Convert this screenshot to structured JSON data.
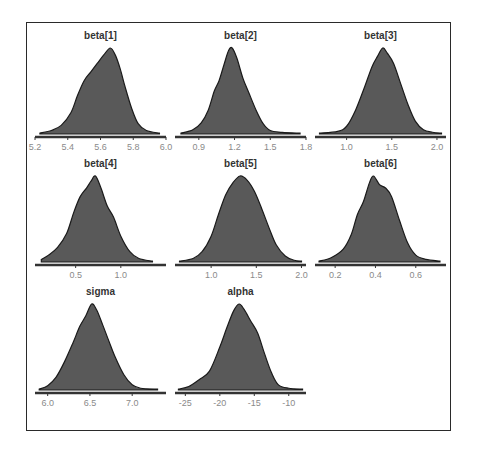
{
  "figure": {
    "frame_color": "#2a2a2a",
    "fill_color": "#595959",
    "line_color": "#1a1a1a",
    "axis_color": "#333333",
    "tick_label_color": "#8a8a8a",
    "title_color": "#333333"
  },
  "chart_data": [
    {
      "type": "area",
      "title": "beta[1]",
      "xlabel": "",
      "ylabel": "",
      "xlim": [
        5.2,
        6.0
      ],
      "ticks": [
        5.2,
        5.4,
        5.6,
        5.8,
        6.0
      ],
      "tick_labels": [
        "5.2",
        "5.4",
        "5.6",
        "5.8",
        "6.0"
      ],
      "grid": false,
      "x": [
        5.23,
        5.3,
        5.36,
        5.42,
        5.46,
        5.5,
        5.54,
        5.58,
        5.62,
        5.66,
        5.69,
        5.72,
        5.75,
        5.79,
        5.83,
        5.88,
        5.96
      ],
      "density": [
        0.01,
        0.04,
        0.1,
        0.25,
        0.45,
        0.62,
        0.72,
        0.82,
        0.92,
        1.0,
        0.92,
        0.76,
        0.55,
        0.3,
        0.12,
        0.04,
        0.01
      ]
    },
    {
      "type": "area",
      "title": "beta[2]",
      "xlim": [
        0.7,
        1.8
      ],
      "ticks": [
        0.9,
        1.2,
        1.5,
        1.8
      ],
      "tick_labels": [
        "0.9",
        "1.2",
        "1.5",
        "1.8"
      ],
      "x": [
        0.75,
        0.85,
        0.92,
        0.98,
        1.03,
        1.07,
        1.11,
        1.15,
        1.18,
        1.22,
        1.27,
        1.32,
        1.38,
        1.44,
        1.5,
        1.6,
        1.75
      ],
      "density": [
        0.01,
        0.05,
        0.13,
        0.28,
        0.5,
        0.62,
        0.8,
        0.97,
        1.0,
        0.88,
        0.65,
        0.48,
        0.28,
        0.12,
        0.04,
        0.02,
        0.01
      ]
    },
    {
      "type": "area",
      "title": "beta[3]",
      "xlim": [
        0.65,
        2.1
      ],
      "ticks": [
        1.0,
        1.5,
        2.0
      ],
      "tick_labels": [
        "1.0",
        "1.5",
        "2.0"
      ],
      "x": [
        0.7,
        0.9,
        1.0,
        1.1,
        1.2,
        1.28,
        1.34,
        1.4,
        1.45,
        1.52,
        1.6,
        1.68,
        1.76,
        1.85,
        1.95,
        2.05
      ],
      "density": [
        0.01,
        0.03,
        0.09,
        0.28,
        0.55,
        0.78,
        0.9,
        1.0,
        0.94,
        0.82,
        0.58,
        0.34,
        0.15,
        0.05,
        0.02,
        0.01
      ]
    },
    {
      "type": "area",
      "title": "beta[4]",
      "xlim": [
        0.05,
        1.5
      ],
      "ticks": [
        0.5,
        1.0
      ],
      "tick_labels": [
        "0.5",
        "1.0"
      ],
      "x": [
        0.12,
        0.2,
        0.3,
        0.4,
        0.48,
        0.55,
        0.62,
        0.67,
        0.72,
        0.78,
        0.85,
        0.92,
        1.0,
        1.1,
        1.2,
        1.35
      ],
      "density": [
        0.03,
        0.08,
        0.17,
        0.33,
        0.58,
        0.76,
        0.86,
        0.94,
        1.0,
        0.86,
        0.65,
        0.52,
        0.3,
        0.12,
        0.04,
        0.01
      ]
    },
    {
      "type": "area",
      "title": "beta[5]",
      "xlim": [
        0.6,
        2.05
      ],
      "ticks": [
        1.0,
        1.5,
        2.0
      ],
      "tick_labels": [
        "1.0",
        "1.5",
        "2.0"
      ],
      "x": [
        0.65,
        0.8,
        0.9,
        1.0,
        1.08,
        1.16,
        1.24,
        1.32,
        1.4,
        1.48,
        1.56,
        1.64,
        1.72,
        1.82,
        1.92,
        2.0
      ],
      "density": [
        0.01,
        0.04,
        0.12,
        0.3,
        0.55,
        0.78,
        0.92,
        1.0,
        0.95,
        0.82,
        0.62,
        0.4,
        0.2,
        0.07,
        0.02,
        0.01
      ]
    },
    {
      "type": "area",
      "title": "beta[6]",
      "xlim": [
        0.1,
        0.75
      ],
      "ticks": [
        0.2,
        0.4,
        0.6
      ],
      "tick_labels": [
        "0.2",
        "0.4",
        "0.6"
      ],
      "x": [
        0.12,
        0.18,
        0.24,
        0.28,
        0.31,
        0.34,
        0.37,
        0.39,
        0.42,
        0.45,
        0.48,
        0.52,
        0.56,
        0.6,
        0.65,
        0.72
      ],
      "density": [
        0.01,
        0.05,
        0.15,
        0.32,
        0.55,
        0.7,
        0.92,
        1.0,
        0.9,
        0.86,
        0.76,
        0.48,
        0.22,
        0.08,
        0.03,
        0.01
      ]
    },
    {
      "type": "area",
      "title": "sigma",
      "xlim": [
        5.85,
        7.4
      ],
      "ticks": [
        6.0,
        6.5,
        7.0
      ],
      "tick_labels": [
        "6.0",
        "6.5",
        "7.0"
      ],
      "x": [
        5.9,
        6.0,
        6.1,
        6.2,
        6.3,
        6.38,
        6.45,
        6.52,
        6.58,
        6.65,
        6.72,
        6.8,
        6.9,
        7.0,
        7.1,
        7.3
      ],
      "density": [
        0.01,
        0.05,
        0.15,
        0.33,
        0.55,
        0.74,
        0.86,
        1.0,
        0.93,
        0.76,
        0.58,
        0.38,
        0.18,
        0.06,
        0.02,
        0.01
      ]
    },
    {
      "type": "area",
      "title": "alpha",
      "xlim": [
        -26.5,
        -7.5
      ],
      "ticks": [
        -25,
        -20,
        -15,
        -10
      ],
      "tick_labels": [
        "-25",
        "-20",
        "-15",
        "-10"
      ],
      "x": [
        -26.0,
        -24.5,
        -23.0,
        -21.5,
        -20.0,
        -19.0,
        -18.0,
        -17.2,
        -16.5,
        -15.5,
        -14.5,
        -13.5,
        -12.5,
        -11.5,
        -10.0,
        -8.0
      ],
      "density": [
        0.01,
        0.04,
        0.12,
        0.22,
        0.5,
        0.72,
        0.92,
        1.0,
        0.94,
        0.8,
        0.66,
        0.42,
        0.2,
        0.06,
        0.02,
        0.01
      ]
    }
  ]
}
